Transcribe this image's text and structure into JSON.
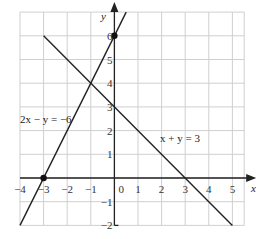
{
  "chart_data": {
    "type": "line",
    "title": "",
    "xlabel": "x",
    "ylabel": "y",
    "xlim": [
      -4,
      5.5
    ],
    "ylim": [
      -2,
      7
    ],
    "grid": true,
    "x_ticks": [
      "−4",
      "−3",
      "−2",
      "−1",
      "0",
      "1",
      "2",
      "3",
      "4",
      "5"
    ],
    "y_ticks": [
      "−2",
      "−1",
      "1",
      "2",
      "3",
      "4",
      "5",
      "6"
    ],
    "series": [
      {
        "name": "2x − y = −6",
        "equation": "y = 2x + 6",
        "x": [
          -4,
          0.5
        ],
        "y": [
          -2,
          7
        ]
      },
      {
        "name": "x + y = 3",
        "equation": "y = 3 − x",
        "x": [
          -3,
          5
        ],
        "y": [
          6,
          -2
        ]
      }
    ],
    "points": [
      {
        "x": -3,
        "y": 0,
        "label": ""
      },
      {
        "x": 0,
        "y": 6,
        "label": ""
      }
    ],
    "annotations": [
      {
        "text": "2x − y = −6",
        "x": -3.6,
        "y": 3.1
      },
      {
        "text": "x + y = 3",
        "x": 1.4,
        "y": 2.6
      }
    ]
  },
  "labels": {
    "x_axis": "x",
    "y_axis": "y",
    "line1": "2x − y = −6",
    "line2": "x + y = 3",
    "origin": "0"
  }
}
